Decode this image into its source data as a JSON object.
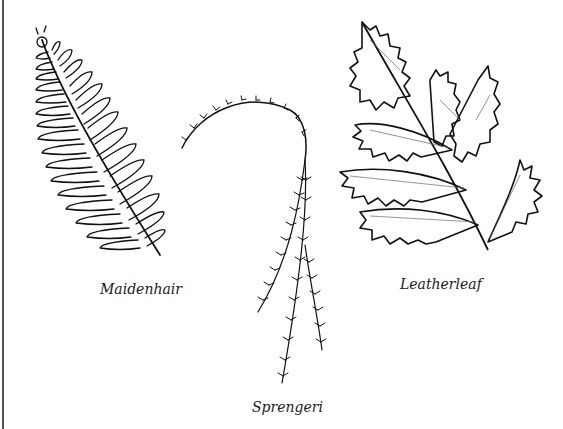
{
  "figure": {
    "type": "botanical line drawing",
    "background_color": "#ffffff",
    "line_color": "#111111"
  },
  "ferns": [
    {
      "id": "maidenhair",
      "label": "Maidenhair"
    },
    {
      "id": "sprengeri",
      "label": "Sprengeri"
    },
    {
      "id": "leatherleaf",
      "label": "Leatherleaf"
    }
  ]
}
